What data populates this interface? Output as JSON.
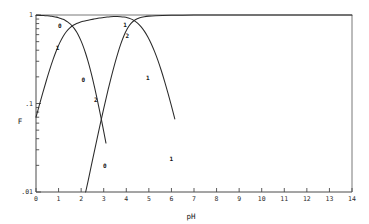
{
  "chart_data": {
    "type": "line",
    "title": "",
    "xlabel": "pH",
    "ylabel": "F",
    "xlim": [
      0,
      14
    ],
    "ylim": [
      0.01,
      1
    ],
    "yscale": "log",
    "xscale": "linear",
    "grid": false,
    "legend": "none",
    "frame": "box",
    "xticks": [
      0,
      1,
      2,
      3,
      4,
      5,
      6,
      7,
      8,
      9,
      10,
      11,
      12,
      13,
      14
    ],
    "xticklabels": [
      "0",
      "1",
      "2",
      "3",
      "4",
      "5",
      "6",
      "7",
      "8",
      "9",
      "10",
      "11",
      "12",
      "13",
      "14"
    ],
    "yticks": [
      1,
      0.1,
      0.01
    ],
    "yticklabels": [
      "1",
      ".1",
      ".01"
    ],
    "y_minor_decades": [
      1,
      0.1
    ],
    "series": [
      {
        "name": "0",
        "label": "0",
        "label_points": [
          {
            "x": 1.05,
            "y": 0.72
          },
          {
            "x": 2.1,
            "y": 0.175
          },
          {
            "x": 3.05,
            "y": 0.0185
          }
        ],
        "x": [
          0.0,
          0.1,
          0.2,
          0.3,
          0.4,
          0.5,
          0.6,
          0.7,
          0.8,
          0.9,
          1.0,
          1.1,
          1.2,
          1.3,
          1.4,
          1.5,
          1.6,
          1.7,
          1.8,
          1.9,
          2.0,
          2.1,
          2.2,
          2.3,
          2.4,
          2.5,
          2.6,
          2.7,
          2.8,
          2.9,
          3.0,
          3.1
        ],
        "y": [
          0.993,
          0.9913,
          0.9891,
          0.9863,
          0.9828,
          0.9784,
          0.9728,
          0.9658,
          0.957,
          0.946,
          0.9323,
          0.9152,
          0.894,
          0.868,
          0.8363,
          0.7982,
          0.753,
          0.7006,
          0.6412,
          0.5759,
          0.5066,
          0.436,
          0.367,
          0.3023,
          0.244,
          0.1931,
          0.1502,
          0.1151,
          0.0871,
          0.0652,
          0.0484,
          0.0357
        ]
      },
      {
        "name": "1",
        "label": "1",
        "label_points": [
          {
            "x": 0.95,
            "y": 0.4
          },
          {
            "x": 3.95,
            "y": 0.73
          },
          {
            "x": 4.95,
            "y": 0.185
          },
          {
            "x": 6.0,
            "y": 0.0225
          }
        ],
        "x": [
          0.0,
          0.15,
          0.3,
          0.45,
          0.6,
          0.75,
          0.9,
          1.05,
          1.2,
          1.35,
          1.5,
          1.65,
          1.8,
          1.95,
          2.1,
          2.25,
          2.4,
          2.55,
          2.7,
          2.85,
          3.0,
          3.15,
          3.3,
          3.45,
          3.6,
          3.75,
          3.9,
          4.05,
          4.2,
          4.35,
          4.5,
          4.65,
          4.8,
          4.95,
          5.1,
          5.25,
          5.4,
          5.55,
          5.7,
          5.85,
          6.0,
          6.15
        ],
        "y": [
          0.07,
          0.0963,
          0.1318,
          0.1785,
          0.2382,
          0.311,
          0.3946,
          0.484,
          0.572,
          0.651,
          0.716,
          0.766,
          0.803,
          0.83,
          0.85,
          0.867,
          0.883,
          0.898,
          0.913,
          0.926,
          0.938,
          0.948,
          0.955,
          0.96,
          0.961,
          0.958,
          0.949,
          0.932,
          0.904,
          0.864,
          0.809,
          0.74,
          0.658,
          0.569,
          0.477,
          0.388,
          0.307,
          0.236,
          0.177,
          0.13,
          0.094,
          0.067
        ]
      },
      {
        "name": "2",
        "label": "2",
        "label_points": [
          {
            "x": 2.65,
            "y": 0.105
          },
          {
            "x": 4.05,
            "y": 0.545
          }
        ],
        "x": [
          2.2,
          2.3,
          2.4,
          2.5,
          2.6,
          2.7,
          2.8,
          2.9,
          3.0,
          3.1,
          3.2,
          3.3,
          3.45,
          3.6,
          3.75,
          3.9,
          4.05,
          4.2,
          4.4,
          4.6,
          4.8,
          5.0,
          5.3,
          5.6,
          6.0,
          6.5,
          7.0,
          7.5,
          8.0,
          9.0,
          10.0,
          11.0,
          12.0,
          13.0,
          14.0
        ],
        "y": [
          0.01,
          0.013,
          0.0172,
          0.0228,
          0.03,
          0.0394,
          0.0516,
          0.0673,
          0.0874,
          0.113,
          0.145,
          0.184,
          0.258,
          0.352,
          0.465,
          0.587,
          0.703,
          0.799,
          0.883,
          0.931,
          0.957,
          0.971,
          0.983,
          0.989,
          0.993,
          0.996,
          0.9975,
          0.9983,
          0.9988,
          0.9993,
          0.9996,
          0.9997,
          0.9998,
          0.9999,
          0.9999
        ]
      }
    ]
  },
  "axes": {
    "x_title": "pH",
    "y_title": "F"
  }
}
